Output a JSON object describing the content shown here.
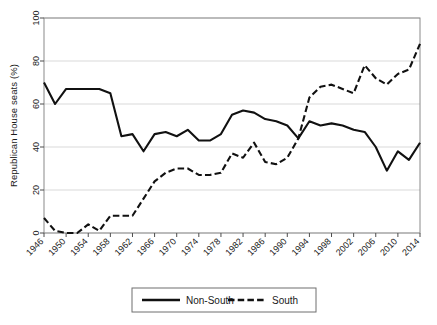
{
  "chart_data": {
    "type": "line",
    "title": "",
    "xlabel": "",
    "ylabel": "Republican House seats (%)",
    "ylim": [
      0,
      100
    ],
    "xlim": [
      1946,
      2014
    ],
    "grid": true,
    "legend_position": "bottom",
    "yticks": [
      0,
      20,
      40,
      60,
      80,
      100
    ],
    "xticks": [
      1946,
      1950,
      1954,
      1958,
      1962,
      1966,
      1970,
      1974,
      1978,
      1982,
      1986,
      1990,
      1994,
      1998,
      2002,
      2006,
      2010,
      2014
    ],
    "x": [
      1946,
      1948,
      1950,
      1952,
      1954,
      1956,
      1958,
      1960,
      1962,
      1964,
      1966,
      1968,
      1970,
      1972,
      1974,
      1976,
      1978,
      1980,
      1982,
      1984,
      1986,
      1988,
      1990,
      1992,
      1994,
      1996,
      1998,
      2000,
      2002,
      2004,
      2006,
      2008,
      2010,
      2012,
      2014
    ],
    "series": [
      {
        "name": "Non-South",
        "style": "solid",
        "color": "#111111",
        "values": [
          70,
          60,
          67,
          67,
          67,
          67,
          65,
          45,
          46,
          38,
          46,
          47,
          45,
          48,
          43,
          43,
          46,
          55,
          57,
          56,
          53,
          52,
          50,
          44,
          52,
          50,
          51,
          50,
          48,
          47,
          40,
          29,
          38,
          34,
          42
        ]
      },
      {
        "name": "South",
        "style": "dashed",
        "color": "#111111",
        "values": [
          7,
          1,
          0,
          0,
          4,
          1,
          8,
          8,
          8,
          16,
          24,
          28,
          30,
          30,
          27,
          27,
          28,
          37,
          35,
          42,
          33,
          32,
          35,
          44,
          63,
          68,
          69,
          67,
          65,
          78,
          72,
          69,
          74,
          76,
          88
        ]
      }
    ],
    "legend": [
      {
        "label": "Non-South",
        "style": "solid"
      },
      {
        "label": "South",
        "style": "dashed"
      }
    ]
  }
}
